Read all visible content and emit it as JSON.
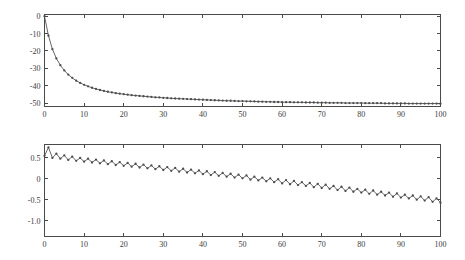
{
  "figure": {
    "name": "two-panel-time-series-figure",
    "background_color": "#ffffff",
    "line_color": "#555555",
    "marker_color": "#4c4c4c",
    "axis_color": "#4a4a4a",
    "panel_count": 2
  },
  "chart_data": [
    {
      "type": "line",
      "name": "top-panel",
      "title": "",
      "xlabel": "",
      "ylabel": "",
      "xlim": [
        0,
        100
      ],
      "ylim": [
        -52,
        1
      ],
      "grid": false,
      "legend": null,
      "markers": "dot",
      "xticks": [
        0,
        10,
        20,
        30,
        40,
        50,
        60,
        70,
        80,
        90,
        100
      ],
      "xticklabels": [
        "0",
        "10",
        "20",
        "30",
        "40",
        "50",
        "60",
        "70",
        "80",
        "90",
        "100"
      ],
      "yticks": [
        0,
        -10,
        -20,
        -30,
        -40,
        -50
      ],
      "yticklabels": [
        "0",
        "-10",
        "-20",
        "-30",
        "-40",
        "-50"
      ],
      "x": [
        0,
        1,
        2,
        3,
        4,
        5,
        6,
        7,
        8,
        9,
        10,
        11,
        12,
        13,
        14,
        15,
        16,
        17,
        18,
        19,
        20,
        21,
        22,
        23,
        24,
        25,
        26,
        27,
        28,
        29,
        30,
        31,
        32,
        33,
        34,
        35,
        36,
        37,
        38,
        39,
        40,
        41,
        42,
        43,
        44,
        45,
        46,
        47,
        48,
        49,
        50,
        51,
        52,
        53,
        54,
        55,
        56,
        57,
        58,
        59,
        60,
        61,
        62,
        63,
        64,
        65,
        66,
        67,
        68,
        69,
        70,
        71,
        72,
        73,
        74,
        75,
        76,
        77,
        78,
        79,
        80,
        81,
        82,
        83,
        84,
        85,
        86,
        87,
        88,
        89,
        90,
        91,
        92,
        93,
        94,
        95,
        96,
        97,
        98,
        99,
        100
      ],
      "y": [
        0.0,
        -11.2,
        -19.0,
        -24.3,
        -28.2,
        -31.2,
        -33.6,
        -35.5,
        -37.1,
        -38.4,
        -39.5,
        -40.4,
        -41.2,
        -41.9,
        -42.5,
        -43.0,
        -43.5,
        -43.9,
        -44.3,
        -44.6,
        -44.9,
        -45.2,
        -45.5,
        -45.7,
        -45.9,
        -46.1,
        -46.3,
        -46.5,
        -46.7,
        -46.8,
        -47.0,
        -47.1,
        -47.3,
        -47.4,
        -47.5,
        -47.6,
        -47.7,
        -47.8,
        -47.9,
        -48.0,
        -48.1,
        -48.2,
        -48.3,
        -48.4,
        -48.5,
        -48.6,
        -48.7,
        -48.7,
        -48.8,
        -48.9,
        -48.9,
        -49.0,
        -49.0,
        -49.1,
        -49.2,
        -49.2,
        -49.3,
        -49.3,
        -49.4,
        -49.4,
        -49.5,
        -49.5,
        -49.5,
        -49.6,
        -49.6,
        -49.6,
        -49.7,
        -49.7,
        -49.7,
        -49.8,
        -49.8,
        -49.8,
        -49.9,
        -49.9,
        -49.9,
        -49.9,
        -50.0,
        -50.0,
        -50.0,
        -50.0,
        -50.0,
        -50.1,
        -50.1,
        -50.1,
        -50.1,
        -50.1,
        -50.2,
        -50.2,
        -50.2,
        -50.2,
        -50.2,
        -50.2,
        -50.3,
        -50.3,
        -50.3,
        -50.3,
        -50.3,
        -50.3,
        -50.3,
        -50.3,
        -50.4
      ]
    },
    {
      "type": "line",
      "name": "bottom-panel",
      "title": "",
      "xlabel": "",
      "ylabel": "",
      "xlim": [
        0,
        100
      ],
      "ylim": [
        -1.38,
        0.82
      ],
      "grid": false,
      "legend": null,
      "markers": "dot",
      "xticks": [
        0,
        10,
        20,
        30,
        40,
        50,
        60,
        70,
        80,
        90,
        100
      ],
      "xticklabels": [
        "0",
        "10",
        "20",
        "30",
        "40",
        "50",
        "60",
        "70",
        "80",
        "90",
        "100"
      ],
      "yticks": [
        0.5,
        0,
        -0.5,
        -1.0
      ],
      "yticklabels": [
        "0.5",
        "0",
        "-0.5",
        "-1.0"
      ],
      "x": [
        0,
        1,
        2,
        3,
        4,
        5,
        6,
        7,
        8,
        9,
        10,
        11,
        12,
        13,
        14,
        15,
        16,
        17,
        18,
        19,
        20,
        21,
        22,
        23,
        24,
        25,
        26,
        27,
        28,
        29,
        30,
        31,
        32,
        33,
        34,
        35,
        36,
        37,
        38,
        39,
        40,
        41,
        42,
        43,
        44,
        45,
        46,
        47,
        48,
        49,
        50,
        51,
        52,
        53,
        54,
        55,
        56,
        57,
        58,
        59,
        60,
        61,
        62,
        63,
        64,
        65,
        66,
        67,
        68,
        69,
        70,
        71,
        72,
        73,
        74,
        75,
        76,
        77,
        78,
        79,
        80,
        81,
        82,
        83,
        84,
        85,
        86,
        87,
        88,
        89,
        90,
        91,
        92,
        93,
        94,
        95,
        96,
        97,
        98,
        99,
        100
      ],
      "y": [
        0.55,
        0.75,
        0.5,
        0.6,
        0.48,
        0.56,
        0.45,
        0.53,
        0.43,
        0.5,
        0.41,
        0.48,
        0.39,
        0.46,
        0.37,
        0.44,
        0.35,
        0.42,
        0.33,
        0.4,
        0.31,
        0.38,
        0.29,
        0.36,
        0.27,
        0.34,
        0.25,
        0.32,
        0.23,
        0.3,
        0.21,
        0.28,
        0.19,
        0.26,
        0.17,
        0.24,
        0.15,
        0.22,
        0.13,
        0.2,
        0.11,
        0.18,
        0.09,
        0.16,
        0.07,
        0.14,
        0.05,
        0.12,
        0.03,
        0.1,
        0.01,
        0.08,
        -0.02,
        0.05,
        -0.04,
        0.03,
        -0.06,
        0.01,
        -0.08,
        -0.01,
        -0.11,
        -0.03,
        -0.13,
        -0.05,
        -0.15,
        -0.08,
        -0.17,
        -0.1,
        -0.2,
        -0.12,
        -0.22,
        -0.14,
        -0.24,
        -0.17,
        -0.27,
        -0.19,
        -0.29,
        -0.21,
        -0.31,
        -0.24,
        -0.33,
        -0.26,
        -0.36,
        -0.28,
        -0.38,
        -0.31,
        -0.4,
        -0.33,
        -0.43,
        -0.35,
        -0.45,
        -0.38,
        -0.47,
        -0.4,
        -0.5,
        -0.42,
        -0.52,
        -0.44,
        -0.55,
        -0.47,
        -0.57,
        -0.49
      ]
    }
  ]
}
